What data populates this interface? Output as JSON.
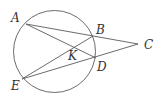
{
  "diagram": {
    "type": "geometry",
    "circle": {
      "cx": 54.5,
      "cy": 51.5,
      "r": 41
    },
    "points": {
      "A": {
        "x": 26,
        "y": 24,
        "label": "A",
        "lx": 11,
        "ly": 22
      },
      "B": {
        "x": 93,
        "y": 36,
        "label": "B",
        "lx": 96,
        "ly": 34
      },
      "C": {
        "x": 138,
        "y": 44,
        "label": "C",
        "lx": 144,
        "ly": 49
      },
      "D": {
        "x": 96,
        "y": 58,
        "label": "D",
        "lx": 97,
        "ly": 71
      },
      "E": {
        "x": 22,
        "y": 79,
        "label": "E",
        "lx": 11,
        "ly": 90
      },
      "K": {
        "x": 72.5,
        "y": 47,
        "label": "K",
        "lx": 68,
        "ly": 60
      }
    },
    "segments": [
      [
        "A",
        "C"
      ],
      [
        "A",
        "D"
      ],
      [
        "E",
        "B"
      ],
      [
        "E",
        "C"
      ]
    ],
    "stroke_color": "#5a5a5a",
    "label_color": "#333333"
  }
}
